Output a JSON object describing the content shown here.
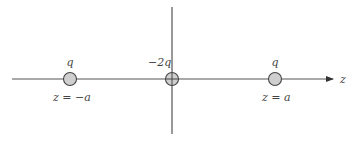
{
  "diagram": {
    "type": "point-charge-configuration",
    "axis": {
      "label": "z",
      "color": "#555555"
    },
    "charges": [
      {
        "charge_label": "q",
        "position_label": "z = −a",
        "x": 70
      },
      {
        "charge_label": "−2q",
        "position_label": "",
        "x": 172
      },
      {
        "charge_label": "q",
        "position_label": "z = a",
        "x": 275
      }
    ],
    "colors": {
      "line": "#555555",
      "charge_fill": "#cfcfcf",
      "charge_stroke": "#444444",
      "text": "#444444"
    }
  }
}
